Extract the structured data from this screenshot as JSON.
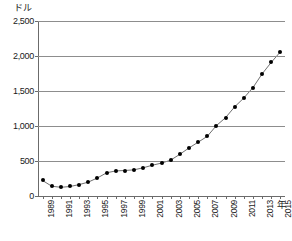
{
  "chart_data": {
    "type": "line",
    "title": "",
    "subtitle": "",
    "xlabel": "年",
    "ylabel": "ドル",
    "ylim": [
      0,
      2500
    ],
    "yticks": [
      0,
      500,
      1000,
      1500,
      2000,
      2500
    ],
    "ytick_labels": [
      "0",
      "500",
      "1,000",
      "1,500",
      "2,000",
      "2,500"
    ],
    "grid": true,
    "legend": "none",
    "marker": "filled-circle",
    "x": [
      1989,
      1990,
      1991,
      1992,
      1993,
      1994,
      1995,
      1996,
      1997,
      1998,
      1999,
      2000,
      2001,
      2002,
      2003,
      2004,
      2005,
      2006,
      2007,
      2008,
      2009,
      2010,
      2011,
      2012,
      2013,
      2014,
      2015
    ],
    "xtick_labels": [
      "1989",
      "1991",
      "1993",
      "1995",
      "1997",
      "1999",
      "2001",
      "2003",
      "2005",
      "2007",
      "2009",
      "2011",
      "2013",
      "2015"
    ],
    "xtick_label_every": 2,
    "values": [
      222,
      140,
      125,
      136,
      163,
      198,
      259,
      331,
      359,
      364,
      374,
      403,
      440,
      470,
      512,
      595,
      685,
      768,
      851,
      1005,
      1118,
      1275,
      1400,
      1550,
      1745,
      1910,
      2060
    ],
    "series": [
      {
        "name": "",
        "values": [
          222,
          140,
          125,
          136,
          163,
          198,
          259,
          331,
          359,
          364,
          374,
          403,
          440,
          470,
          512,
          595,
          685,
          768,
          851,
          1005,
          1118,
          1275,
          1400,
          1550,
          1745,
          1910,
          2060
        ]
      }
    ],
    "colors": {
      "line": "#707070",
      "marker": "#000000",
      "grid": "#8d8d8d",
      "axis": "#6b6b6b",
      "text": "#1a1a1a",
      "background": "#ffffff"
    }
  }
}
